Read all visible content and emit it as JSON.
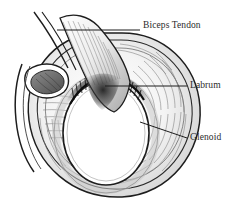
{
  "figure": {
    "background_color": "#ffffff",
    "ink_color": "#1d1d1d",
    "label_color": "#2b2b2b",
    "mid_gray": "#9a9a9a",
    "light_gray": "#d8d8d8",
    "shadow_gray": "#555555"
  },
  "labels": [
    {
      "id": "biceps-tendon",
      "text": "Biceps Tendon",
      "leader": {
        "type": "horizontal",
        "x1": 57,
        "y1": 30,
        "x2": 140,
        "y2": 30
      }
    },
    {
      "id": "labrum",
      "text": "Labrum",
      "leader": {
        "type": "horizontal",
        "x1": 105,
        "y1": 86,
        "x2": 187,
        "y2": 86
      }
    },
    {
      "id": "glenoid",
      "text": "Glenoid",
      "leader": {
        "type": "diagonal",
        "x1": 140,
        "y1": 122,
        "x2": 187,
        "y2": 138
      }
    }
  ],
  "structures": [
    {
      "name": "outer-capsule-rim",
      "description": "outermost oval contour of the glenoid capsule"
    },
    {
      "name": "inner-capsule-rim",
      "description": "second concentric oval contour inside the outer rim"
    },
    {
      "name": "glenoid-socket",
      "description": "central white oval articular surface of the glenoid"
    },
    {
      "name": "labrum-ring",
      "description": "fibrocartilage rim encircling the glenoid socket"
    },
    {
      "name": "labral-fringe",
      "description": "dark frayed superior labral edge at the socket top"
    },
    {
      "name": "biceps-tendon-band",
      "description": "broad striated tendon sweeping from upper left into the superior labrum"
    },
    {
      "name": "sublabral-recess",
      "description": "notched shaded opening on the left capsule wall"
    },
    {
      "name": "inferior-fiber-fan",
      "description": "radiating capsular fibers converging at the inferior pole"
    }
  ]
}
